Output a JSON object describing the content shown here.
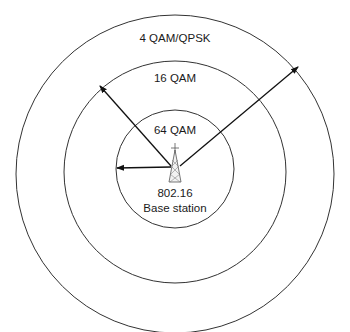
{
  "diagram": {
    "type": "concentric-coverage-zones",
    "zones": [
      {
        "id": "outer",
        "label": "4 QAM/QPSK"
      },
      {
        "id": "middle",
        "label": "16 QAM"
      },
      {
        "id": "inner",
        "label": "64 QAM"
      }
    ],
    "station": {
      "line1": "802.16",
      "line2": "Base station",
      "icon": "radio-tower-icon"
    },
    "colors": {
      "stroke": "#333333",
      "text": "#1a1a1a",
      "background": "#ffffff"
    }
  }
}
